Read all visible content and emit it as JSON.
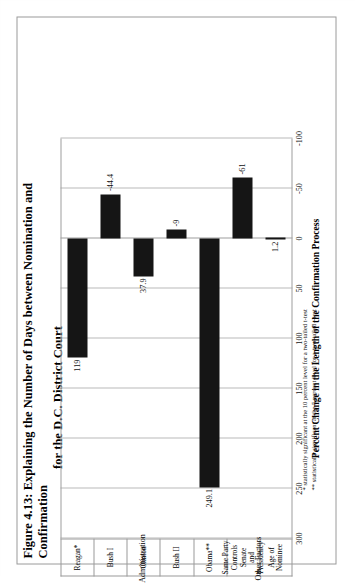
{
  "figure": {
    "title_line1": "Figure 4.13: Explaining the Number of Days between Nomination and Confirmation",
    "title_line2": "for the D.C. District Court",
    "footnote_1": "* statistically significant at the 10 percent level for a two-tailed t-test",
    "footnote_2": "** statistically significant at the 5 percent level for a two-tailed t-test",
    "group_label_1": "Administration",
    "group_label_2": "Other Factors"
  },
  "chart_data": {
    "type": "bar",
    "orientation": "vertical",
    "title": "Figure 4.13: Explaining the Number of Days between Nomination and Confirmation for the D.C. District Court",
    "xlabel": "",
    "ylabel": "Percent Change in the Length of the Confirmation Process",
    "ylim": [
      -100,
      300
    ],
    "yticks": [
      "300",
      "250",
      "200",
      "150",
      "100",
      "50",
      "0",
      "-50",
      "-100"
    ],
    "ytick_values": [
      300,
      250,
      200,
      150,
      100,
      50,
      0,
      -50,
      -100
    ],
    "grid": true,
    "legend": "none",
    "bar_color": "#151515",
    "categories": [
      "Reagan*",
      "Bush I",
      "Clinton",
      "Bush II",
      "Obama**",
      "Same Party\nControls Senate\nand Presidency",
      "Age of Nominee"
    ],
    "values": [
      119,
      -44.4,
      37.9,
      -9,
      249.1,
      -61,
      1.2
    ],
    "value_labels": [
      "119",
      "-44.4",
      "37.9",
      "-9",
      "249.1",
      "-61",
      "1.2"
    ],
    "groups": [
      {
        "label": "Administration",
        "categories": [
          "Reagan*",
          "Bush I",
          "Clinton",
          "Bush II",
          "Obama**"
        ]
      },
      {
        "label": "Other Factors",
        "categories": [
          "Same Party Controls Senate and Presidency",
          "Age of Nominee"
        ]
      }
    ]
  }
}
